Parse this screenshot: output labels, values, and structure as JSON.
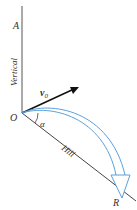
{
  "diagram": {
    "labels": {
      "point_a": "A",
      "vertical": "Vertical",
      "velocity": "v",
      "velocity_sub": "0",
      "origin": "O",
      "angle": "α",
      "hill": "Hill",
      "range_point": "R"
    },
    "colors": {
      "lines": "#3a3a3a",
      "trajectory": "#5aa0dc",
      "text": "#333333"
    }
  }
}
